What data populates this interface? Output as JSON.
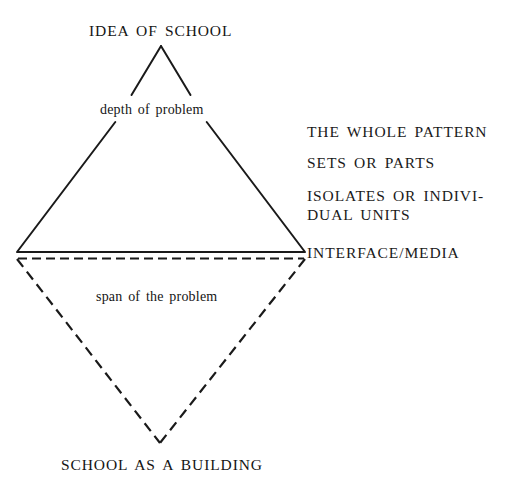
{
  "diagram": {
    "title_top": "IDEA OF SCHOOL",
    "title_bottom": "SCHOOL AS A BUILDING",
    "annotation_upper": "depth of problem",
    "annotation_lower": "span of the problem",
    "side_labels": [
      {
        "lines": [
          "THE WHOLE PATTERN"
        ]
      },
      {
        "lines": [
          "SETS OR PARTS"
        ]
      },
      {
        "lines": [
          "ISOLATES OR INDIVI-",
          "DUAL UNITS"
        ]
      },
      {
        "lines": [
          "INTERFACE/MEDIA"
        ]
      }
    ],
    "colors": {
      "ink": "#1a1a1a",
      "background": "#ffffff"
    },
    "geometry": {
      "apex": [
        161,
        46
      ],
      "left_vertex": [
        17,
        252
      ],
      "right_vertex": [
        305,
        252
      ],
      "dashed_top_left": [
        17,
        258
      ],
      "dashed_top_right": [
        305,
        258
      ],
      "bottom_vertex": [
        160,
        443
      ],
      "upper_gap_y_start": 95,
      "upper_gap_y_end": 122
    }
  }
}
